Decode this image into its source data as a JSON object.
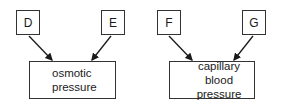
{
  "panels": [
    {
      "inputs": [
        {
          "label": "D"
        },
        {
          "label": "E"
        }
      ],
      "result": {
        "direction": "down",
        "line1": "osmotic",
        "line2": "pressure"
      }
    },
    {
      "inputs": [
        {
          "label": "F"
        },
        {
          "label": "G"
        }
      ],
      "result": {
        "direction": "up",
        "line1": "capillary",
        "line2": "blood pressure"
      }
    }
  ]
}
